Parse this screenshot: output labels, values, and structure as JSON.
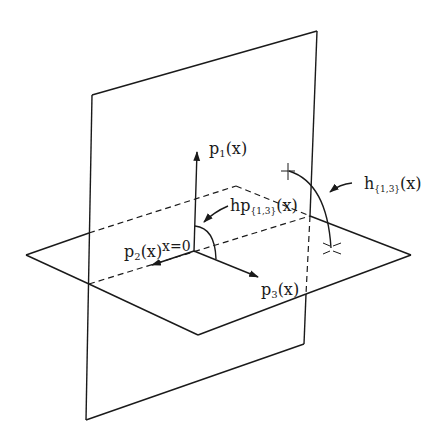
{
  "diagram": {
    "type": "geometric-3d-planes",
    "stroke_color": "#1a1a1a",
    "background": "#ffffff",
    "labels": {
      "p1": {
        "base": "p",
        "sub": "1",
        "tail": "(x)"
      },
      "p2": {
        "base": "p",
        "sub": "2",
        "tail": "(x)"
      },
      "p3": {
        "base": "p",
        "sub": "3",
        "tail": "(x)"
      },
      "origin": "x=0",
      "hp": {
        "base": "hp",
        "sub": "{1,3}",
        "tail": "(x)"
      },
      "h": {
        "base": "h",
        "sub": "{1,3}",
        "tail": "(x)"
      }
    },
    "elements": [
      "vertical-plane",
      "horizontal-plane",
      "axis-p1",
      "axis-p2",
      "axis-p3",
      "projected-arc-hp13",
      "arc-h13",
      "dashed-projection-lines"
    ]
  }
}
